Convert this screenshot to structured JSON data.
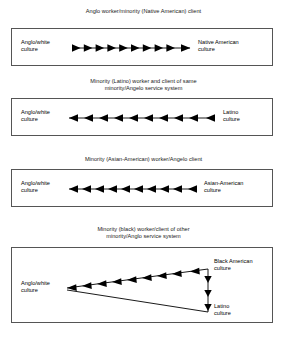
{
  "figure": {
    "background_color": "#ffffff",
    "line_color": "#000000",
    "box_border_color": "#555555"
  },
  "panels": [
    {
      "id": "panel-1",
      "title": "Anglo worker/minority (Native American) client",
      "left_label": "Anglo/white\nculture",
      "right_label": "Native American\nculture",
      "flow_direction": "right",
      "arrowhead_count": 10,
      "diagram_type": "single-horizontal-arrow"
    },
    {
      "id": "panel-2",
      "title": "Minority (Latino) worker and client of same\nminority/Angelo service system",
      "left_label": "Anglo/white\nculture",
      "right_label": "Latino\nculture",
      "flow_direction": "left",
      "arrowhead_count": 10,
      "diagram_type": "single-horizontal-arrow"
    },
    {
      "id": "panel-3",
      "title": "Minority (Asian-American) worker/Angelo client",
      "left_label": "Anglo/white\nculture",
      "right_label": "Asian-American\nculture",
      "flow_direction": "left",
      "arrowhead_count": 10,
      "diagram_type": "single-horizontal-arrow"
    },
    {
      "id": "panel-4",
      "title": "Minority (black) worker/client of other\nminority/Anglo service system",
      "left_label": "Anglo/white\nculture",
      "right_top_label": "Black American\nculture",
      "right_bottom_label": "Latino\nculture",
      "flow_direction": "left-and-down",
      "arrowhead_count_diagonal": 9,
      "arrowhead_count_vertical": 3,
      "diagram_type": "triangle-flow"
    }
  ]
}
